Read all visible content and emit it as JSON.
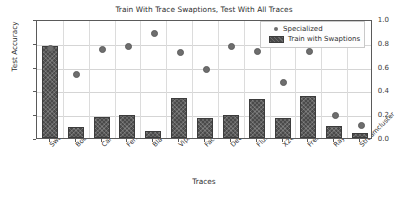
{
  "chart_data": {
    "type": "bar",
    "title": "Train With Trace Swaptions, Test With All Traces",
    "xlabel": "Traces",
    "ylabel": "Test Accuracy",
    "ylim": [
      0.0,
      1.0
    ],
    "yticks": [
      "0.0",
      "0.2",
      "0.4",
      "0.6",
      "0.8",
      "1.0"
    ],
    "ytick_values": [
      0.0,
      0.2,
      0.4,
      0.6,
      0.8,
      1.0
    ],
    "grid": true,
    "legend_position": "upper right",
    "categories": [
      "Swaptions",
      "Bodytrack",
      "Canneal",
      "Ferret",
      "Blackscholes",
      "Vips",
      "Facesim",
      "Dedup",
      "Fluidanimate",
      "X264",
      "Freqmine",
      "Raytrace",
      "Streamcluster"
    ],
    "series": [
      {
        "name": "Specialized",
        "marker": "circle",
        "color": "#6e6e6e",
        "values": [
          0.775,
          0.555,
          0.77,
          0.795,
          0.9,
          0.74,
          0.605,
          0.79,
          0.75,
          0.49,
          0.75,
          0.215,
          0.13
        ]
      },
      {
        "name": "Train with Swaptions",
        "marker": "bar",
        "color": "#4a4a4a",
        "values": [
          0.775,
          0.09,
          0.18,
          0.19,
          0.06,
          0.34,
          0.165,
          0.195,
          0.33,
          0.17,
          0.35,
          0.105,
          0.045
        ]
      }
    ]
  },
  "legend": {
    "entries": [
      {
        "label": "Specialized"
      },
      {
        "label": "Train with Swaptions"
      }
    ]
  }
}
